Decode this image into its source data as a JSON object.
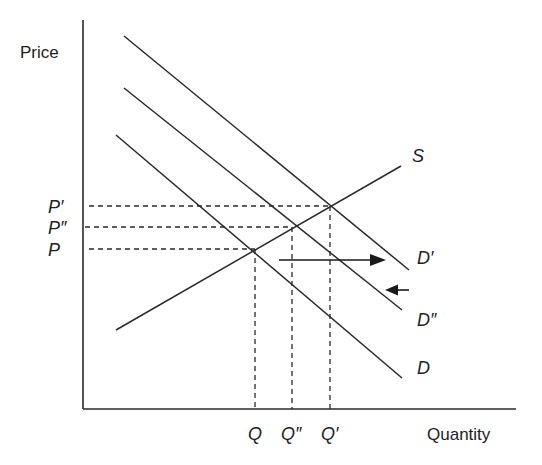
{
  "diagram": {
    "type": "supply-demand",
    "axes": {
      "y_label": "Price",
      "x_label": "Quantity"
    },
    "curves": {
      "supply": {
        "label": "S",
        "slope": "upward"
      },
      "demand_original": {
        "label": "D",
        "slope": "downward"
      },
      "demand_shifted_out": {
        "label": "D′",
        "slope": "downward"
      },
      "demand_partial_return": {
        "label": "D″",
        "slope": "downward"
      }
    },
    "price_ticks": [
      "P′",
      "P″",
      "P"
    ],
    "quantity_ticks": [
      "Q",
      "Q″",
      "Q′"
    ],
    "equilibria": [
      {
        "curve": "D",
        "price": "P",
        "quantity": "Q"
      },
      {
        "curve": "D″",
        "price": "P″",
        "quantity": "Q″"
      },
      {
        "curve": "D′",
        "price": "P′",
        "quantity": "Q′"
      }
    ],
    "shifts": [
      {
        "direction": "right",
        "meaning": "demand shifts from D to D′"
      },
      {
        "direction": "left",
        "meaning": "demand shifts back from D′ to D″"
      }
    ],
    "colors": {
      "ink": "#2a2a2a",
      "background": "#ffffff"
    }
  }
}
